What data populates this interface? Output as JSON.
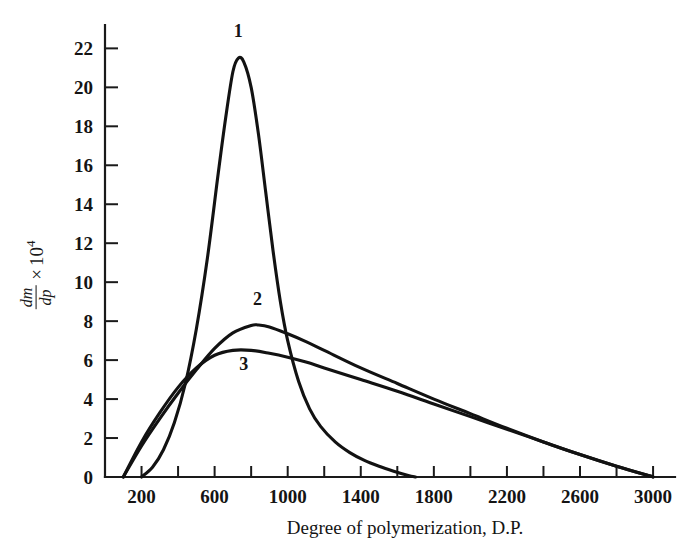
{
  "figure": {
    "background_color": "#ffffff",
    "ink_color": "#121212"
  },
  "axes": {
    "x": {
      "title": "Degree of polymerization, D.P.",
      "min": 0,
      "max": 3120,
      "tick_step": 200,
      "label_step": 400,
      "tick_values": [
        200,
        400,
        600,
        800,
        1000,
        1200,
        1400,
        1600,
        1800,
        2000,
        2200,
        2400,
        2600,
        2800,
        3000
      ],
      "tick_labels": [
        {
          "value": 200,
          "text": "200"
        },
        {
          "value": 600,
          "text": "600"
        },
        {
          "value": 1000,
          "text": "1000"
        },
        {
          "value": 1400,
          "text": "1400"
        },
        {
          "value": 1800,
          "text": "1800"
        },
        {
          "value": 2200,
          "text": "2200"
        },
        {
          "value": 2600,
          "text": "2600"
        },
        {
          "value": 3000,
          "text": "3000"
        }
      ]
    },
    "y": {
      "title_fraction_numerator": "dm",
      "title_fraction_denominator": "dp",
      "title_multiplier": "×",
      "title_base": "10",
      "title_exponent": "4",
      "min": 0,
      "max": 23.2,
      "tick_step": 2,
      "tick_values": [
        0,
        2,
        4,
        6,
        8,
        10,
        12,
        14,
        16,
        18,
        20,
        22
      ],
      "tick_labels": [
        "0",
        "2",
        "4",
        "6",
        "8",
        "10",
        "12",
        "14",
        "16",
        "18",
        "20",
        "22"
      ]
    }
  },
  "chart_data": {
    "type": "line",
    "title": "",
    "subtitle": "",
    "xlabel": "Degree of polymerization, D.P.",
    "ylabel": "dm/dp x 10^4",
    "xlim": [
      0,
      3120
    ],
    "ylim": [
      0,
      23.2
    ],
    "grid": false,
    "legend_position": "inline-curve-labels",
    "annotations": [
      {
        "text": "1",
        "x": 730,
        "y": 22.6
      },
      {
        "text": "2",
        "x": 835,
        "y": 8.85
      },
      {
        "text": "3",
        "x": 760,
        "y": 5.5
      }
    ],
    "series": [
      {
        "name": "1",
        "label": "1",
        "peak_x": 730,
        "peak_y": 21.5,
        "x": [
          200,
          260,
          320,
          380,
          440,
          500,
          560,
          620,
          660,
          700,
          730,
          760,
          800,
          840,
          880,
          920,
          960,
          1000,
          1060,
          1120,
          1180,
          1260,
          1340,
          1420,
          1500,
          1580,
          1660,
          1700
        ],
        "y": [
          0.0,
          0.5,
          1.4,
          2.8,
          4.8,
          7.6,
          11.2,
          15.6,
          18.4,
          20.8,
          21.5,
          21.3,
          20.0,
          17.6,
          14.6,
          11.6,
          9.0,
          7.0,
          4.9,
          3.5,
          2.6,
          1.8,
          1.25,
          0.85,
          0.55,
          0.3,
          0.08,
          0.0
        ]
      },
      {
        "name": "2",
        "label": "2",
        "peak_x": 840,
        "peak_y": 7.8,
        "x": [
          100,
          200,
          300,
          400,
          500,
          600,
          700,
          800,
          840,
          900,
          1000,
          1100,
          1200,
          1400,
          1600,
          1800,
          2000,
          2200,
          2400,
          2600,
          2800,
          3000
        ],
        "y": [
          0.0,
          1.6,
          3.0,
          4.3,
          5.5,
          6.6,
          7.4,
          7.78,
          7.8,
          7.7,
          7.35,
          6.95,
          6.5,
          5.6,
          4.8,
          4.0,
          3.25,
          2.5,
          1.8,
          1.15,
          0.55,
          0.0
        ]
      },
      {
        "name": "3",
        "label": "3",
        "peak_x": 700,
        "peak_y": 6.5,
        "x": [
          100,
          200,
          300,
          400,
          500,
          600,
          700,
          800,
          900,
          1000,
          1100,
          1200,
          1400,
          1600,
          1800,
          2000,
          2200,
          2400,
          2600,
          2800,
          3000
        ],
        "y": [
          0.0,
          1.8,
          3.3,
          4.6,
          5.6,
          6.25,
          6.5,
          6.5,
          6.35,
          6.15,
          5.9,
          5.6,
          5.0,
          4.4,
          3.75,
          3.1,
          2.45,
          1.8,
          1.15,
          0.55,
          0.0
        ]
      }
    ]
  }
}
